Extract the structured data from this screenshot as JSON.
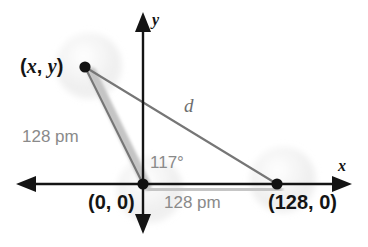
{
  "figure": {
    "type": "geometry-diagram"
  },
  "axes": {
    "x_label": "x",
    "y_label": "y",
    "x_axis_name": "horizontal-axis",
    "y_axis_name": "vertical-axis",
    "color": "#141414"
  },
  "points": [
    {
      "name": "point-xy",
      "label": "(x, y)",
      "label_prefix": "(",
      "label_x": "x",
      "label_mid": ", ",
      "label_y": "y",
      "label_suffix": ")",
      "cx": 85,
      "cy": 67
    },
    {
      "name": "point-origin",
      "label": "(0, 0)",
      "cx": 143,
      "cy": 184
    },
    {
      "name": "point-128-0",
      "label": "(128, 0)",
      "cx": 277,
      "cy": 184
    }
  ],
  "bonds": [
    {
      "name": "bond-left",
      "length_label": "128 pm",
      "from": "point-origin",
      "to": "point-xy",
      "color": "#c9c9c9"
    },
    {
      "name": "bond-right",
      "length_label": "128 pm",
      "from": "point-origin",
      "to": "point-128-0",
      "color": "#c9c9c9"
    }
  ],
  "measurements": {
    "angle": "117°",
    "angle_value": 117,
    "angle_unit": "degrees",
    "bond_length_left": "128 pm",
    "bond_length_right": "128 pm",
    "distance_label": "d"
  },
  "colors": {
    "axis": "#141414",
    "label_black": "#141414",
    "label_gray": "#8a8a8a",
    "triangle_line": "#767676",
    "bond_fill": "#c9c9c9",
    "atom_sphere": "#ebebeb",
    "background": "#ffffff"
  }
}
